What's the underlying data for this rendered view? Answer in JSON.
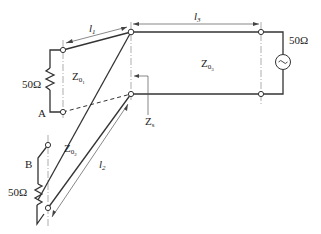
{
  "diagram": {
    "title": "",
    "type": "transmission-line circuit",
    "labels": {
      "l1": "l",
      "l1_sub": "1",
      "l2": "l",
      "l2_sub": "2",
      "l3": "l",
      "l3_sub": "3",
      "z01": "Z",
      "z01_sub": "0",
      "z01_subsub": "1",
      "z02": "Z",
      "z02_sub": "0",
      "z02_subsub": "2",
      "z03": "Z",
      "z03_sub": "0",
      "z03_subsub": "3",
      "zs": "Z",
      "zs_sub": "s",
      "point_a": "A",
      "point_b": "B",
      "load_a": "50Ω",
      "load_b": "50Ω",
      "source_impedance": "50Ω"
    },
    "components": [
      {
        "name": "load-resistor-A",
        "value": "50Ω"
      },
      {
        "name": "load-resistor-B",
        "value": "50Ω"
      },
      {
        "name": "ac-source",
        "impedance": "50Ω",
        "symbol": "~"
      }
    ],
    "lines": [
      {
        "name": "line-1",
        "impedance": "Z01",
        "length": "l1"
      },
      {
        "name": "line-2",
        "impedance": "Z02",
        "length": "l2"
      },
      {
        "name": "line-3",
        "impedance": "Z03",
        "length": "l3"
      }
    ],
    "colors": {
      "ink": "#333333",
      "background": "#ffffff"
    }
  }
}
